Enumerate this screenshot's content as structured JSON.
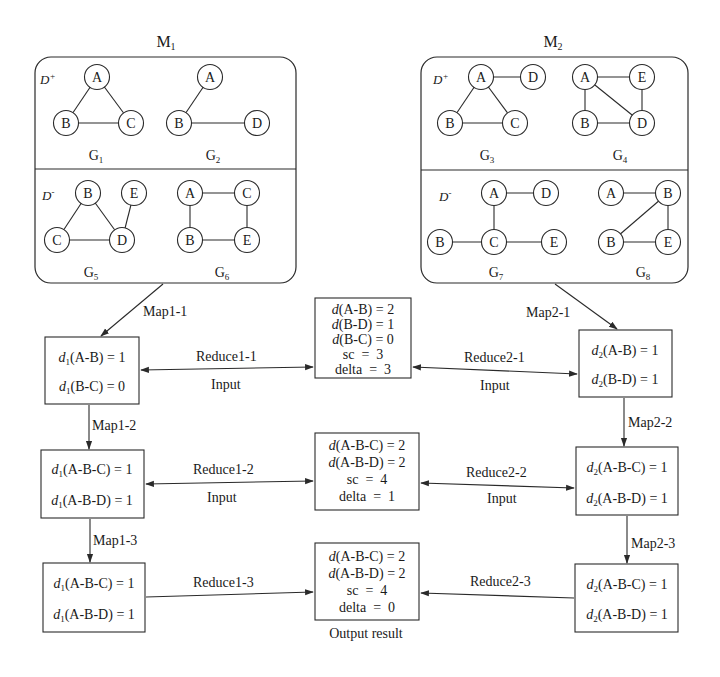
{
  "colors": {
    "stroke": "#2a2a2a",
    "text": "#1a1a1a",
    "background": "#ffffff"
  },
  "modules": [
    {
      "title": "M",
      "title_sub": "1",
      "positive_label": "D",
      "positive_sup": "+",
      "negative_label": "D",
      "negative_sup": "-",
      "graphs": [
        {
          "name": "G",
          "sub": "1",
          "nodes": [
            "A",
            "B",
            "C"
          ],
          "edges": [
            [
              "A",
              "B"
            ],
            [
              "A",
              "C"
            ],
            [
              "B",
              "C"
            ]
          ]
        },
        {
          "name": "G",
          "sub": "2",
          "nodes": [
            "A",
            "B",
            "D"
          ],
          "edges": [
            [
              "A",
              "B"
            ],
            [
              "B",
              "D"
            ]
          ]
        },
        {
          "name": "G",
          "sub": "5",
          "nodes": [
            "B",
            "E",
            "C",
            "D"
          ],
          "edges": [
            [
              "B",
              "C"
            ],
            [
              "B",
              "D"
            ],
            [
              "C",
              "D"
            ],
            [
              "E",
              "D"
            ]
          ]
        },
        {
          "name": "G",
          "sub": "6",
          "nodes": [
            "A",
            "C",
            "B",
            "E"
          ],
          "edges": [
            [
              "A",
              "C"
            ],
            [
              "A",
              "B"
            ],
            [
              "C",
              "E"
            ],
            [
              "B",
              "E"
            ]
          ]
        }
      ]
    },
    {
      "title": "M",
      "title_sub": "2",
      "positive_label": "D",
      "positive_sup": "+",
      "negative_label": "D",
      "negative_sup": "-",
      "graphs": [
        {
          "name": "G",
          "sub": "3",
          "nodes": [
            "A",
            "D",
            "B",
            "C"
          ],
          "edges": [
            [
              "A",
              "D"
            ],
            [
              "A",
              "B"
            ],
            [
              "A",
              "C"
            ],
            [
              "B",
              "C"
            ]
          ]
        },
        {
          "name": "G",
          "sub": "4",
          "nodes": [
            "A",
            "E",
            "B",
            "D"
          ],
          "edges": [
            [
              "A",
              "E"
            ],
            [
              "A",
              "B"
            ],
            [
              "A",
              "D"
            ],
            [
              "E",
              "D"
            ],
            [
              "B",
              "D"
            ]
          ]
        },
        {
          "name": "G",
          "sub": "7",
          "nodes": [
            "A",
            "D",
            "B",
            "C",
            "E"
          ],
          "edges": [
            [
              "A",
              "D"
            ],
            [
              "A",
              "C"
            ],
            [
              "B",
              "C"
            ],
            [
              "C",
              "E"
            ]
          ]
        },
        {
          "name": "G",
          "sub": "8",
          "nodes": [
            "A",
            "B",
            "B",
            "E"
          ],
          "edges": [
            [
              "A",
              "B"
            ],
            [
              "B",
              "B"
            ],
            [
              "B",
              "E"
            ],
            [
              "B",
              "E"
            ]
          ]
        }
      ]
    }
  ],
  "flow": {
    "map1": [
      "Map1-1",
      "Map1-2",
      "Map1-3"
    ],
    "map2": [
      "Map2-1",
      "Map2-2",
      "Map2-3"
    ],
    "reduce1": [
      "Reduce1-1",
      "Reduce1-2",
      "Reduce1-3"
    ],
    "reduce2": [
      "Reduce2-1",
      "Reduce2-2",
      "Reduce2-3"
    ],
    "input_label": "Input",
    "output_label": "Output result",
    "left_boxes": [
      [
        {
          "d": "d",
          "sub": "1",
          "rest": "(A-B) = 1"
        },
        {
          "d": "d",
          "sub": "1",
          "rest": "(B-C) = 0"
        }
      ],
      [
        {
          "d": "d",
          "sub": "1",
          "rest": "(A-B-C) = 1"
        },
        {
          "d": "d",
          "sub": "1",
          "rest": "(A-B-D) = 1"
        }
      ],
      [
        {
          "d": "d",
          "sub": "1",
          "rest": "(A-B-C) = 1"
        },
        {
          "d": "d",
          "sub": "1",
          "rest": "(A-B-D) = 1"
        }
      ]
    ],
    "right_boxes": [
      [
        {
          "d": "d",
          "sub": "2",
          "rest": "(A-B) = 1"
        },
        {
          "d": "d",
          "sub": "2",
          "rest": "(B-D) = 1"
        }
      ],
      [
        {
          "d": "d",
          "sub": "2",
          "rest": "(A-B-C) = 1"
        },
        {
          "d": "d",
          "sub": "2",
          "rest": "(A-B-D) = 1"
        }
      ],
      [
        {
          "d": "d",
          "sub": "2",
          "rest": "(A-B-C) = 1"
        },
        {
          "d": "d",
          "sub": "2",
          "rest": "(A-B-D) = 1"
        }
      ]
    ],
    "center_boxes": [
      {
        "lines": [
          {
            "d": "d",
            "rest": "(A-B) = 2"
          },
          {
            "d": "d",
            "rest": "(B-D) = 1"
          },
          {
            "d": "d",
            "rest": "(B-C) = 0"
          }
        ],
        "sc": "sc  =  3",
        "delta": "delta  =  3"
      },
      {
        "lines": [
          {
            "d": "d",
            "rest": "(A-B-C) = 2"
          },
          {
            "d": "d",
            "rest": "(A-B-D) = 2"
          }
        ],
        "sc": "sc  =  4",
        "delta": "delta  =  1"
      },
      {
        "lines": [
          {
            "d": "d",
            "rest": "(A-B-C) = 2"
          },
          {
            "d": "d",
            "rest": "(A-B-D) = 2"
          }
        ],
        "sc": "sc  =  4",
        "delta": "delta  =  0"
      }
    ]
  }
}
